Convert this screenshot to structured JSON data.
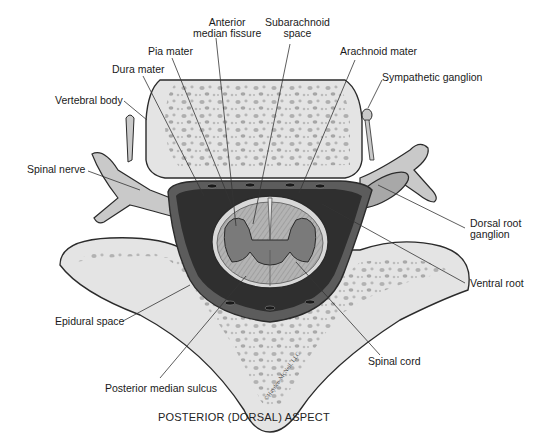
{
  "diagram": {
    "caption": "POSTERIOR (DORSAL) ASPECT",
    "credit": "©Hayden-McNeil, LLC",
    "colors": {
      "bone": "#e4e4e4",
      "bone_spots": "#a9a9a9",
      "outline": "#2b2b2b",
      "nerve": "#c9c9c9",
      "dura": "#5c5c5c",
      "dark_space": "#2f2f2f",
      "white_matter": "#b8b8b8",
      "gray_matter": "#7a7a7a",
      "leader_line": "#333333"
    },
    "labels": [
      {
        "id": "anterior-median-fissure",
        "text_lines": [
          "Anterior",
          "median fissure"
        ]
      },
      {
        "id": "subarachnoid-space",
        "text_lines": [
          "Subarachnoid",
          "space"
        ]
      },
      {
        "id": "pia-mater",
        "text_lines": [
          "Pia mater"
        ]
      },
      {
        "id": "arachnoid-mater",
        "text_lines": [
          "Arachnoid mater"
        ]
      },
      {
        "id": "dura-mater",
        "text_lines": [
          "Dura mater"
        ]
      },
      {
        "id": "sympathetic-ganglion",
        "text_lines": [
          "Sympathetic ganglion"
        ]
      },
      {
        "id": "vertebral-body",
        "text_lines": [
          "Vertebral body"
        ]
      },
      {
        "id": "spinal-nerve",
        "text_lines": [
          "Spinal nerve"
        ]
      },
      {
        "id": "dorsal-root-ganglion",
        "text_lines": [
          "Dorsal root",
          "ganglion"
        ]
      },
      {
        "id": "ventral-root",
        "text_lines": [
          "Ventral root"
        ]
      },
      {
        "id": "epidural-space",
        "text_lines": [
          "Epidural space"
        ]
      },
      {
        "id": "spinal-cord",
        "text_lines": [
          "Spinal cord"
        ]
      },
      {
        "id": "posterior-median-sulcus",
        "text_lines": [
          "Posterior median sulcus"
        ]
      }
    ]
  }
}
